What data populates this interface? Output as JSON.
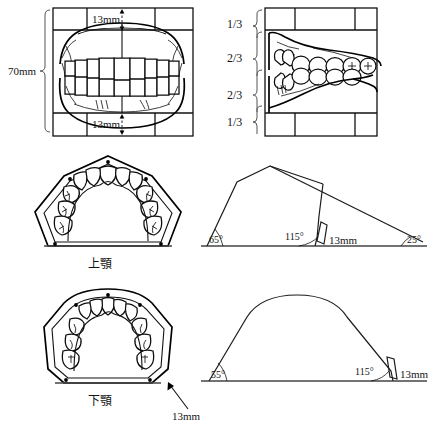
{
  "figure": {
    "background_color": "#ffffff",
    "line_color": "#111111"
  },
  "panels": {
    "front_view": {
      "name": "frontal occlusion view",
      "upper_dimension": "13mm",
      "lower_dimension": "13mm",
      "height_dimension": "70mm"
    },
    "lateral_view": {
      "name": "lateral occlusion view",
      "proportions": [
        "1/3",
        "2/3",
        "2/3",
        "1/3"
      ]
    },
    "maxillary_arch": {
      "name": "maxillary arch occlusal view",
      "label": "上顎"
    },
    "maxillary_geometry": {
      "name": "maxillary arch angular schema",
      "angle_left": "65°",
      "angle_center": "115°",
      "angle_right": "25°",
      "segment_label": "13mm"
    },
    "mandibular_arch": {
      "name": "mandibular arch occlusal view",
      "label": "下顎",
      "callout": "13mm"
    },
    "mandibular_geometry": {
      "name": "mandibular arch angular schema",
      "angle_left": "55°",
      "angle_center": "115°",
      "segment_label": "13mm"
    }
  }
}
